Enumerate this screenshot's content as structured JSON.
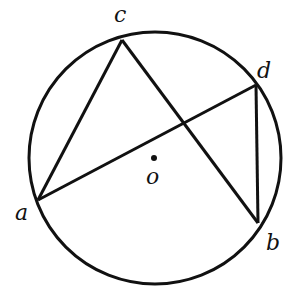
{
  "diagram": {
    "type": "circle-geometry",
    "circle": {
      "center": [
        155,
        158
      ],
      "radius": 126,
      "label": "o"
    },
    "points": [
      {
        "id": "c",
        "label": "c",
        "xy": [
          122,
          40
        ],
        "label_xy": [
          114,
          6
        ]
      },
      {
        "id": "d",
        "label": "d",
        "xy": [
          256,
          85
        ],
        "label_xy": [
          257,
          62
        ]
      },
      {
        "id": "a",
        "label": "a",
        "xy": [
          38,
          200
        ],
        "label_xy": [
          15,
          204
        ]
      },
      {
        "id": "b",
        "label": "b",
        "xy": [
          258,
          223
        ],
        "label_xy": [
          266,
          234
        ]
      }
    ],
    "segments": [
      [
        "a",
        "c"
      ],
      [
        "c",
        "b"
      ],
      [
        "a",
        "d"
      ],
      [
        "d",
        "b"
      ]
    ],
    "center_label": {
      "label": "o",
      "label_xy": [
        146,
        168
      ]
    },
    "stroke_color": "#111111"
  }
}
